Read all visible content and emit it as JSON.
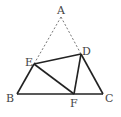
{
  "diagram": {
    "type": "geometry",
    "colors": {
      "solid": "#222222",
      "dashed": "#666666",
      "label": "#444444"
    },
    "points": {
      "A": {
        "label": "A",
        "x": 61,
        "y": 17
      },
      "B": {
        "label": "B",
        "x": 17,
        "y": 94
      },
      "C": {
        "label": "C",
        "x": 103,
        "y": 94
      },
      "D": {
        "label": "D",
        "x": 81,
        "y": 54
      },
      "E": {
        "label": "E",
        "x": 34,
        "y": 64
      },
      "F": {
        "label": "F",
        "x": 74,
        "y": 94
      }
    },
    "segments": [
      {
        "from": "A",
        "to": "E",
        "style": "dashed"
      },
      {
        "from": "A",
        "to": "D",
        "style": "dashed"
      },
      {
        "from": "B",
        "to": "C",
        "style": "solid"
      },
      {
        "from": "B",
        "to": "E",
        "style": "solid"
      },
      {
        "from": "D",
        "to": "C",
        "style": "solid"
      },
      {
        "from": "E",
        "to": "D",
        "style": "solid"
      },
      {
        "from": "E",
        "to": "F",
        "style": "solid"
      },
      {
        "from": "D",
        "to": "F",
        "style": "solid"
      }
    ]
  }
}
